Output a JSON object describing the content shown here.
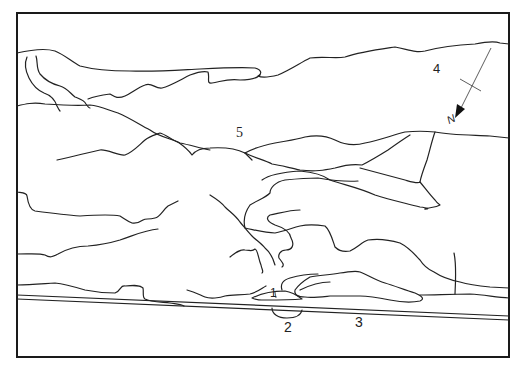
{
  "figure": {
    "type": "sketch-map",
    "colors": {
      "line": "#222222",
      "background": "#ffffff"
    }
  },
  "labels": [
    {
      "id": "1",
      "text": "1",
      "x": 270,
      "y": 288
    },
    {
      "id": "2",
      "text": "2",
      "x": 287,
      "y": 320
    },
    {
      "id": "3",
      "text": "3",
      "x": 358,
      "y": 316
    },
    {
      "id": "4",
      "text": "4",
      "x": 434,
      "y": 63
    },
    {
      "id": "5",
      "text": "5",
      "x": 236,
      "y": 127
    }
  ],
  "north_arrow": {
    "label": "N",
    "icon": "north-arrow-icon"
  }
}
